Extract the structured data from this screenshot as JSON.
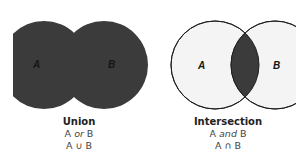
{
  "diagrams": [
    {
      "id": "union",
      "title": "Union",
      "line1_a": "A ",
      "line1_op": "or",
      "line1_b": " B",
      "notation": "A ∪ B",
      "set_a_label": "A",
      "set_b_label": "B",
      "shaded_region": "A or B"
    },
    {
      "id": "intersection",
      "title": "Intersection",
      "line1_a": "A ",
      "line1_op": "and",
      "line1_b": " B",
      "notation": "A ∩ B",
      "set_a_label": "A",
      "set_b_label": "B",
      "shaded_region": "A and B"
    }
  ],
  "colors": {
    "shade": "#3b3b3b",
    "circle_fill": "#f4f4f4",
    "outline": "#1e1e1e",
    "background": "#ffffff"
  }
}
